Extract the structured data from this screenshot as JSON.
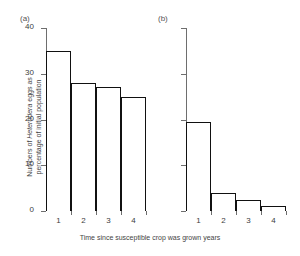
{
  "chart_data": {
    "type": "bar",
    "title": "",
    "xlabel": "Time since susceptible crop was grown  years",
    "ylabel_line1_prefix": "Numbers of ",
    "ylabel_line1_italic": "Heterodera",
    "ylabel_line1_suffix": " eggs as",
    "ylabel_line2": "percentage of initial population",
    "ylim": [
      0,
      40
    ],
    "yticks": [
      0,
      10,
      20,
      30,
      40
    ],
    "ytick_labels": [
      "0",
      "10",
      "20",
      "30",
      "40"
    ],
    "grid": false,
    "legend": false,
    "panels": [
      {
        "label": "(a)",
        "categories": [
          "1",
          "2",
          "3",
          "4"
        ],
        "values": [
          35,
          28,
          27,
          25
        ],
        "y_axis_labeled": true
      },
      {
        "label": "(b)",
        "categories": [
          "1",
          "2",
          "3",
          "4"
        ],
        "values": [
          19.5,
          4,
          2.5,
          1
        ],
        "y_axis_labeled": false
      }
    ]
  }
}
